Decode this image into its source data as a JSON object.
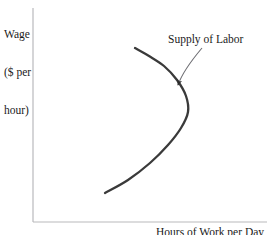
{
  "chart_data": {
    "type": "line",
    "title": "",
    "subtitle": "",
    "xlabel": "Hours of Work per Day",
    "ylabel_lines": [
      "Wage",
      "($ per",
      "hour)"
    ],
    "ylabel": "Wage ($ per hour)",
    "grid": false,
    "legend_position": "none",
    "xlim": [
      0,
      1
    ],
    "ylim": [
      0,
      1
    ],
    "x_ticks": [],
    "y_ticks": [],
    "axis_color": "#b9b9bc",
    "curve_color": "#3a3a3a",
    "annotations": [
      {
        "name": "supply-of-labor",
        "text": "Supply of Labor",
        "text_x": 168,
        "text_y": 33,
        "arrow_from": [
          202,
          48
        ],
        "arrow_to": [
          178,
          85
        ]
      }
    ],
    "series": [
      {
        "name": "Supply of Labor",
        "description": "Backward-bending labor supply curve",
        "points": [
          [
            105,
            193
          ],
          [
            128,
            180
          ],
          [
            150,
            163
          ],
          [
            168,
            145
          ],
          [
            181,
            128
          ],
          [
            188,
            112
          ],
          [
            186,
            96
          ],
          [
            177,
            80
          ],
          [
            164,
            66
          ],
          [
            149,
            56
          ],
          [
            135,
            48
          ]
        ]
      }
    ]
  },
  "axes": {
    "y_axis_x": 33,
    "y_axis_top": 8,
    "x_axis_y": 222,
    "x_axis_right": 267
  }
}
